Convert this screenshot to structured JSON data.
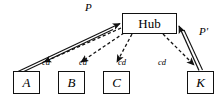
{
  "diagram": {
    "colors": {
      "stroke": "#111111",
      "fill": "#ffffff",
      "text": "#000000"
    },
    "hub": {
      "label": "Hub",
      "x": 122,
      "y": 13,
      "width": 55,
      "height": 21
    },
    "leaves": [
      {
        "id": "A",
        "label": "A",
        "x": 13,
        "y": 71
      },
      {
        "id": "B",
        "label": "B",
        "x": 58,
        "y": 71
      },
      {
        "id": "C",
        "label": "C",
        "x": 103,
        "y": 71
      },
      {
        "id": "K",
        "label": "K",
        "x": 187,
        "y": 71
      }
    ],
    "edge_labels": {
      "p": "P",
      "p_prime": "P'",
      "cd": "cd"
    },
    "cd_labels": [
      {
        "text": "cd",
        "x": 42,
        "y": 58
      },
      {
        "text": "cd",
        "x": 79,
        "y": 58
      },
      {
        "text": "cd",
        "x": 118,
        "y": 58
      },
      {
        "text": "cd",
        "x": 158,
        "y": 58
      }
    ],
    "solid_edges": [
      {
        "from": "A",
        "to": "Hub",
        "label": "P",
        "style": "solid",
        "arrow_at": "Hub"
      },
      {
        "from": "K",
        "to": "Hub",
        "label": "P'",
        "style": "solid",
        "arrow_at": "Hub"
      }
    ],
    "dashed_edges": [
      {
        "from": "Hub",
        "to": "A",
        "label": "cd",
        "style": "dashed",
        "arrow_at": "A"
      },
      {
        "from": "Hub",
        "to": "B",
        "label": "cd",
        "style": "dashed",
        "arrow_at": "B"
      },
      {
        "from": "Hub",
        "to": "C",
        "label": "cd",
        "style": "dashed",
        "arrow_at": "C"
      },
      {
        "from": "Hub",
        "to": "K",
        "label": "cd",
        "style": "dashed",
        "arrow_at": "K"
      }
    ]
  }
}
